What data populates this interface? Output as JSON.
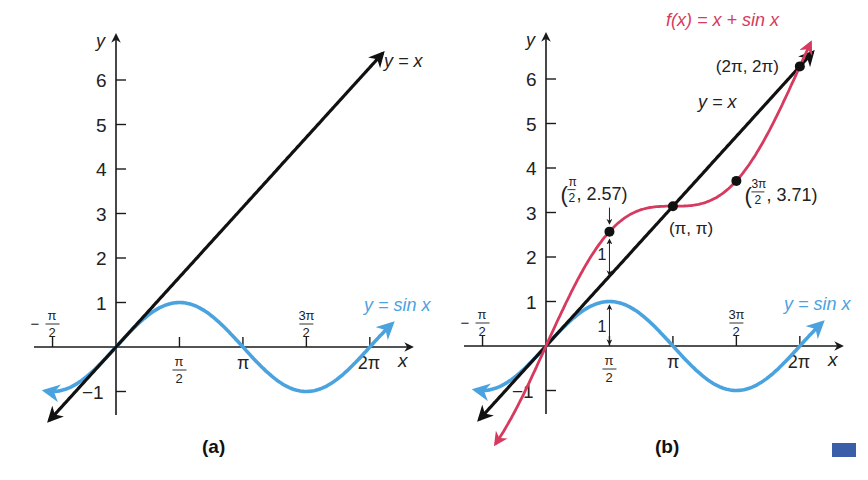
{
  "panels": [
    {
      "id": "a",
      "caption": "(a)",
      "origin_px": [
        116,
        347
      ],
      "y_axis_label": "y",
      "x_axis_label": "x",
      "y_ticks": [
        "6",
        "5",
        "4",
        "3",
        "2",
        "1",
        "−1"
      ],
      "x_ticks": [
        {
          "value": "-pi/2",
          "num": "π",
          "den": "2",
          "sign": "−",
          "pos": "above"
        },
        {
          "value": "pi/2",
          "num": "π",
          "den": "2",
          "pos": "below"
        },
        {
          "value": "pi",
          "text": "π",
          "pos": "below"
        },
        {
          "value": "3pi/2",
          "num": "3π",
          "den": "2",
          "pos": "above"
        },
        {
          "value": "2pi",
          "text": "2π",
          "pos": "below"
        }
      ],
      "curves": [
        {
          "name": "y = x",
          "label": "y = x",
          "color": "#111111"
        },
        {
          "name": "y = sin x",
          "label": "y = sin x",
          "color": "#4aa3df"
        }
      ]
    },
    {
      "id": "b",
      "caption": "(b)",
      "origin_px": [
        546,
        346
      ],
      "y_axis_label": "y",
      "x_axis_label": "x",
      "y_ticks": [
        "6",
        "5",
        "4",
        "3",
        "2",
        "1",
        "−1"
      ],
      "x_ticks": [
        {
          "value": "-pi/2",
          "num": "π",
          "den": "2",
          "sign": "−",
          "pos": "above"
        },
        {
          "value": "pi/2",
          "num": "π",
          "den": "2",
          "pos": "below"
        },
        {
          "value": "pi",
          "text": "π",
          "pos": "below"
        },
        {
          "value": "3pi/2",
          "num": "3π",
          "den": "2",
          "pos": "above"
        },
        {
          "value": "2pi",
          "text": "2π",
          "pos": "below"
        }
      ],
      "curves": [
        {
          "name": "y = x",
          "label": "y = x",
          "color": "#111111"
        },
        {
          "name": "y = sin x",
          "label": "y = sin x",
          "color": "#4aa3df"
        },
        {
          "name": "f(x) = x + sin x",
          "label": "f(x) = x + sin x",
          "color": "#d63a5e"
        }
      ],
      "points": [
        {
          "label_num": "π",
          "label_den": "2",
          "label_rest": ", 2.57",
          "x": 1.5708,
          "y": 2.57
        },
        {
          "label": "(π, π)",
          "x": 3.1416,
          "y": 3.1416
        },
        {
          "label_num": "3π",
          "label_den": "2",
          "label_rest": ", 3.71",
          "x": 4.7124,
          "y": 3.71
        },
        {
          "label": "(2π, 2π)",
          "x": 6.2832,
          "y": 6.2832
        }
      ],
      "annotations": [
        {
          "text": "1",
          "meaning": "gap between f(x) and y=x at x=pi/2"
        },
        {
          "text": "1",
          "meaning": "height of sin x at x=pi/2"
        }
      ]
    }
  ],
  "colors": {
    "axis": "#1a1a1a",
    "line": "#111111",
    "sine": "#4aa3df",
    "sum": "#d63a5e",
    "corner_mark": "#3a5ea8"
  }
}
